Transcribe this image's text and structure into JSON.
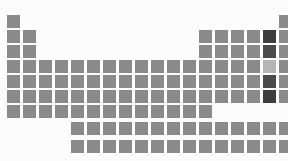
{
  "figure": {
    "name": "periodic-table-heatmap",
    "background_color": "#fcfcfc",
    "width": 288,
    "height": 161
  },
  "chart_data": {
    "type": "heatmap",
    "title": "",
    "subtitle": "",
    "xlabel": "",
    "ylabel": "",
    "legend": [],
    "grid": false,
    "layout": {
      "origin_x": 7,
      "origin_y": 15,
      "cell_size": 13,
      "pitch_x": 16,
      "pitch_y": 15,
      "columns": 18,
      "main_rows": 7,
      "fblock_rows": 2,
      "fblock_start_column": 5,
      "fblock_columns": 14,
      "fblock_origin_y": 122,
      "fblock_pitch_y": 18
    },
    "colors": {
      "default": "#8a8a8a",
      "dark": "#4a4a4a",
      "darkest": "#3d3d3d",
      "light": "#b5b5b5",
      "background": "#fcfcfc"
    },
    "color_scale": {
      "name": "grayscale",
      "low_color": "#b5b5b5",
      "mid_color": "#8a8a8a",
      "high_color": "#3d3d3d",
      "note": "darker cells indicate higher values"
    },
    "cells": [
      {
        "row": 1,
        "col": 1,
        "value": 1,
        "color": "#8a8a8a"
      },
      {
        "row": 1,
        "col": 18,
        "value": 1,
        "color": "#8a8a8a"
      },
      {
        "row": 2,
        "col": 1,
        "value": 1,
        "color": "#8a8a8a"
      },
      {
        "row": 2,
        "col": 2,
        "value": 1,
        "color": "#8a8a8a"
      },
      {
        "row": 2,
        "col": 13,
        "value": 1,
        "color": "#8a8a8a"
      },
      {
        "row": 2,
        "col": 14,
        "value": 1,
        "color": "#8a8a8a"
      },
      {
        "row": 2,
        "col": 15,
        "value": 1,
        "color": "#8a8a8a"
      },
      {
        "row": 2,
        "col": 16,
        "value": 1,
        "color": "#8a8a8a"
      },
      {
        "row": 2,
        "col": 17,
        "value": 3,
        "color": "#3d3d3d"
      },
      {
        "row": 2,
        "col": 18,
        "value": 1,
        "color": "#8a8a8a"
      },
      {
        "row": 3,
        "col": 1,
        "value": 1,
        "color": "#8a8a8a"
      },
      {
        "row": 3,
        "col": 2,
        "value": 1,
        "color": "#8a8a8a"
      },
      {
        "row": 3,
        "col": 13,
        "value": 1,
        "color": "#8a8a8a"
      },
      {
        "row": 3,
        "col": 14,
        "value": 1,
        "color": "#8a8a8a"
      },
      {
        "row": 3,
        "col": 15,
        "value": 1,
        "color": "#8a8a8a"
      },
      {
        "row": 3,
        "col": 16,
        "value": 1,
        "color": "#8a8a8a"
      },
      {
        "row": 3,
        "col": 17,
        "value": 3,
        "color": "#4a4a4a"
      },
      {
        "row": 3,
        "col": 18,
        "value": 1,
        "color": "#8a8a8a"
      },
      {
        "row": 4,
        "col": 1,
        "value": 1,
        "color": "#8a8a8a"
      },
      {
        "row": 4,
        "col": 2,
        "value": 1,
        "color": "#8a8a8a"
      },
      {
        "row": 4,
        "col": 3,
        "value": 1,
        "color": "#8a8a8a"
      },
      {
        "row": 4,
        "col": 4,
        "value": 1,
        "color": "#8a8a8a"
      },
      {
        "row": 4,
        "col": 5,
        "value": 1,
        "color": "#8a8a8a"
      },
      {
        "row": 4,
        "col": 6,
        "value": 1,
        "color": "#8a8a8a"
      },
      {
        "row": 4,
        "col": 7,
        "value": 1,
        "color": "#8a8a8a"
      },
      {
        "row": 4,
        "col": 8,
        "value": 1,
        "color": "#8a8a8a"
      },
      {
        "row": 4,
        "col": 9,
        "value": 1,
        "color": "#8a8a8a"
      },
      {
        "row": 4,
        "col": 10,
        "value": 1,
        "color": "#8a8a8a"
      },
      {
        "row": 4,
        "col": 11,
        "value": 1,
        "color": "#8a8a8a"
      },
      {
        "row": 4,
        "col": 12,
        "value": 1,
        "color": "#8a8a8a"
      },
      {
        "row": 4,
        "col": 13,
        "value": 1,
        "color": "#8a8a8a"
      },
      {
        "row": 4,
        "col": 14,
        "value": 1,
        "color": "#8a8a8a"
      },
      {
        "row": 4,
        "col": 15,
        "value": 1,
        "color": "#8a8a8a"
      },
      {
        "row": 4,
        "col": 16,
        "value": 1,
        "color": "#8a8a8a"
      },
      {
        "row": 4,
        "col": 17,
        "value": 0,
        "color": "#b5b5b5"
      },
      {
        "row": 4,
        "col": 18,
        "value": 1,
        "color": "#8a8a8a"
      },
      {
        "row": 5,
        "col": 1,
        "value": 1,
        "color": "#8a8a8a"
      },
      {
        "row": 5,
        "col": 2,
        "value": 1,
        "color": "#8a8a8a"
      },
      {
        "row": 5,
        "col": 3,
        "value": 1,
        "color": "#8a8a8a"
      },
      {
        "row": 5,
        "col": 4,
        "value": 1,
        "color": "#8a8a8a"
      },
      {
        "row": 5,
        "col": 5,
        "value": 1,
        "color": "#8a8a8a"
      },
      {
        "row": 5,
        "col": 6,
        "value": 1,
        "color": "#8a8a8a"
      },
      {
        "row": 5,
        "col": 7,
        "value": 1,
        "color": "#8a8a8a"
      },
      {
        "row": 5,
        "col": 8,
        "value": 1,
        "color": "#8a8a8a"
      },
      {
        "row": 5,
        "col": 9,
        "value": 1,
        "color": "#8a8a8a"
      },
      {
        "row": 5,
        "col": 10,
        "value": 1,
        "color": "#8a8a8a"
      },
      {
        "row": 5,
        "col": 11,
        "value": 1,
        "color": "#8a8a8a"
      },
      {
        "row": 5,
        "col": 12,
        "value": 1,
        "color": "#8a8a8a"
      },
      {
        "row": 5,
        "col": 13,
        "value": 1,
        "color": "#8a8a8a"
      },
      {
        "row": 5,
        "col": 14,
        "value": 1,
        "color": "#8a8a8a"
      },
      {
        "row": 5,
        "col": 15,
        "value": 1,
        "color": "#8a8a8a"
      },
      {
        "row": 5,
        "col": 16,
        "value": 1,
        "color": "#8a8a8a"
      },
      {
        "row": 5,
        "col": 17,
        "value": 3,
        "color": "#4a4a4a"
      },
      {
        "row": 5,
        "col": 18,
        "value": 1,
        "color": "#8a8a8a"
      },
      {
        "row": 6,
        "col": 1,
        "value": 1,
        "color": "#8a8a8a"
      },
      {
        "row": 6,
        "col": 2,
        "value": 1,
        "color": "#8a8a8a"
      },
      {
        "row": 6,
        "col": 3,
        "value": 1,
        "color": "#8a8a8a"
      },
      {
        "row": 6,
        "col": 4,
        "value": 1,
        "color": "#8a8a8a"
      },
      {
        "row": 6,
        "col": 5,
        "value": 1,
        "color": "#8a8a8a"
      },
      {
        "row": 6,
        "col": 6,
        "value": 1,
        "color": "#8a8a8a"
      },
      {
        "row": 6,
        "col": 7,
        "value": 1,
        "color": "#8a8a8a"
      },
      {
        "row": 6,
        "col": 8,
        "value": 1,
        "color": "#8a8a8a"
      },
      {
        "row": 6,
        "col": 9,
        "value": 1,
        "color": "#8a8a8a"
      },
      {
        "row": 6,
        "col": 10,
        "value": 1,
        "color": "#8a8a8a"
      },
      {
        "row": 6,
        "col": 11,
        "value": 1,
        "color": "#8a8a8a"
      },
      {
        "row": 6,
        "col": 12,
        "value": 1,
        "color": "#8a8a8a"
      },
      {
        "row": 6,
        "col": 13,
        "value": 1,
        "color": "#8a8a8a"
      },
      {
        "row": 6,
        "col": 14,
        "value": 1,
        "color": "#8a8a8a"
      },
      {
        "row": 6,
        "col": 15,
        "value": 1,
        "color": "#8a8a8a"
      },
      {
        "row": 6,
        "col": 16,
        "value": 1,
        "color": "#8a8a8a"
      },
      {
        "row": 6,
        "col": 17,
        "value": 3,
        "color": "#3d3d3d"
      },
      {
        "row": 6,
        "col": 18,
        "value": 1,
        "color": "#8a8a8a"
      },
      {
        "row": 7,
        "col": 1,
        "value": 1,
        "color": "#8a8a8a"
      },
      {
        "row": 7,
        "col": 2,
        "value": 1,
        "color": "#8a8a8a"
      },
      {
        "row": 7,
        "col": 3,
        "value": 1,
        "color": "#8a8a8a"
      },
      {
        "row": 7,
        "col": 4,
        "value": 1,
        "color": "#8a8a8a"
      },
      {
        "row": 7,
        "col": 5,
        "value": 1,
        "color": "#8a8a8a"
      },
      {
        "row": 7,
        "col": 6,
        "value": 1,
        "color": "#8a8a8a"
      },
      {
        "row": 7,
        "col": 7,
        "value": 1,
        "color": "#8a8a8a"
      },
      {
        "row": 7,
        "col": 8,
        "value": 1,
        "color": "#8a8a8a"
      },
      {
        "row": 7,
        "col": 9,
        "value": 1,
        "color": "#8a8a8a"
      },
      {
        "row": 7,
        "col": 10,
        "value": 1,
        "color": "#8a8a8a"
      },
      {
        "row": 7,
        "col": 11,
        "value": 1,
        "color": "#8a8a8a"
      },
      {
        "row": 7,
        "col": 12,
        "value": 1,
        "color": "#8a8a8a"
      },
      {
        "row": 7,
        "col": 13,
        "value": 1,
        "color": "#8a8a8a"
      }
    ],
    "fblock_cells": [
      {
        "row": 1,
        "col": 1,
        "value": 1,
        "color": "#8a8a8a"
      },
      {
        "row": 1,
        "col": 2,
        "value": 1,
        "color": "#8a8a8a"
      },
      {
        "row": 1,
        "col": 3,
        "value": 1,
        "color": "#8a8a8a"
      },
      {
        "row": 1,
        "col": 4,
        "value": 1,
        "color": "#8a8a8a"
      },
      {
        "row": 1,
        "col": 5,
        "value": 1,
        "color": "#8a8a8a"
      },
      {
        "row": 1,
        "col": 6,
        "value": 1,
        "color": "#8a8a8a"
      },
      {
        "row": 1,
        "col": 7,
        "value": 1,
        "color": "#8a8a8a"
      },
      {
        "row": 1,
        "col": 8,
        "value": 1,
        "color": "#8a8a8a"
      },
      {
        "row": 1,
        "col": 9,
        "value": 1,
        "color": "#8a8a8a"
      },
      {
        "row": 1,
        "col": 10,
        "value": 1,
        "color": "#8a8a8a"
      },
      {
        "row": 1,
        "col": 11,
        "value": 1,
        "color": "#8a8a8a"
      },
      {
        "row": 1,
        "col": 12,
        "value": 1,
        "color": "#8a8a8a"
      },
      {
        "row": 1,
        "col": 13,
        "value": 1,
        "color": "#8a8a8a"
      },
      {
        "row": 1,
        "col": 14,
        "value": 1,
        "color": "#8a8a8a"
      },
      {
        "row": 2,
        "col": 1,
        "value": 1,
        "color": "#8a8a8a"
      },
      {
        "row": 2,
        "col": 2,
        "value": 1,
        "color": "#8a8a8a"
      },
      {
        "row": 2,
        "col": 3,
        "value": 1,
        "color": "#8a8a8a"
      },
      {
        "row": 2,
        "col": 4,
        "value": 1,
        "color": "#8a8a8a"
      },
      {
        "row": 2,
        "col": 5,
        "value": 1,
        "color": "#8a8a8a"
      },
      {
        "row": 2,
        "col": 6,
        "value": 1,
        "color": "#8a8a8a"
      },
      {
        "row": 2,
        "col": 7,
        "value": 1,
        "color": "#8a8a8a"
      },
      {
        "row": 2,
        "col": 8,
        "value": 1,
        "color": "#8a8a8a"
      },
      {
        "row": 2,
        "col": 9,
        "value": 1,
        "color": "#8a8a8a"
      },
      {
        "row": 2,
        "col": 10,
        "value": 1,
        "color": "#8a8a8a"
      },
      {
        "row": 2,
        "col": 11,
        "value": 1,
        "color": "#8a8a8a"
      },
      {
        "row": 2,
        "col": 12,
        "value": 1,
        "color": "#8a8a8a"
      },
      {
        "row": 2,
        "col": 13,
        "value": 1,
        "color": "#8a8a8a"
      },
      {
        "row": 2,
        "col": 14,
        "value": 1,
        "color": "#8a8a8a"
      }
    ]
  }
}
